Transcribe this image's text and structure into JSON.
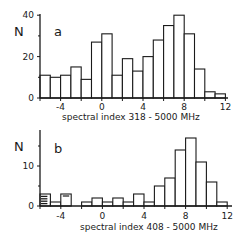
{
  "chart_data": [
    {
      "type": "bar",
      "panel_label": "a",
      "ylabel": "N",
      "xlabel": "spectral index  318 - 5000 MHz",
      "xlim": [
        -6,
        12.5
      ],
      "ylim": [
        0,
        41
      ],
      "xticks": [
        -4,
        0,
        4,
        8,
        12
      ],
      "xtick_labels": [
        "-4",
        "0",
        "4",
        "8",
        "12"
      ],
      "yticks": [
        0,
        20,
        40
      ],
      "ytick_labels": [
        "0",
        "20",
        "40"
      ],
      "grid": false,
      "bin_edges": [
        -6,
        -5,
        -4,
        -3,
        -2,
        -1,
        0,
        1,
        2,
        3,
        4,
        5,
        6,
        7,
        8,
        9,
        10,
        11,
        12
      ],
      "values": [
        11,
        10,
        11,
        15,
        9,
        27,
        31,
        11,
        19,
        13,
        20,
        28,
        35,
        40,
        31,
        14,
        3,
        2
      ]
    },
    {
      "type": "bar",
      "panel_label": "b",
      "ylabel": "N",
      "xlabel": "spectral index  408 - 5000 MHz",
      "xlim": [
        -6,
        12.5
      ],
      "ylim": [
        0,
        19
      ],
      "xticks": [
        -4,
        0,
        4,
        8,
        12
      ],
      "xtick_labels": [
        "-4",
        "0",
        "4",
        "8",
        "12"
      ],
      "yticks": [
        0,
        10
      ],
      "ytick_labels": [
        "0",
        "10"
      ],
      "grid": false,
      "bin_edges": [
        -6,
        -5,
        -4,
        -3,
        -2,
        -1,
        0,
        1,
        2,
        3,
        4,
        5,
        6,
        7,
        8,
        9,
        10,
        11,
        12
      ],
      "values": [
        3,
        1,
        3,
        0,
        1,
        2,
        1,
        2,
        1,
        3,
        1,
        5,
        7,
        14,
        17,
        11,
        6,
        1
      ],
      "hatched_bins": [
        0
      ],
      "annotations": [
        "horizontal hatching in bin -6 to -5",
        "dash mark in bin -4 to -3"
      ]
    }
  ],
  "panels": {
    "a": {
      "letter": "a",
      "ylabel": "N",
      "xlabel": "spectral index  318 - 5000 MHz"
    },
    "b": {
      "letter": "b",
      "ylabel": "N",
      "xlabel": "spectral index  408 - 5000 MHz"
    }
  },
  "colors": {
    "ink": "#1a1a1a",
    "background": "#ffffff",
    "bar_fill": "#ffffff"
  }
}
